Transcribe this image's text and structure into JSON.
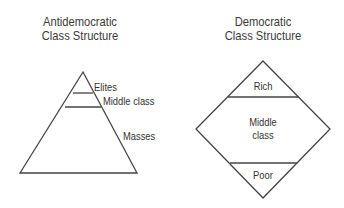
{
  "left_diagram": {
    "title_line1": "Antidemocratic",
    "title_line2": "Class Structure",
    "shape": "triangle",
    "layers": [
      {
        "label": "Elites"
      },
      {
        "label": "Middle class"
      },
      {
        "label": "Masses"
      }
    ]
  },
  "right_diagram": {
    "title_line1": "Democratic",
    "title_line2": "Class Structure",
    "shape": "diamond",
    "layers": [
      {
        "label": "Rich"
      },
      {
        "label_line1": "Middle",
        "label_line2": "class"
      },
      {
        "label": "Poor"
      }
    ]
  },
  "colors": {
    "stroke": "#444444",
    "text": "#333333",
    "background": "#ffffff"
  }
}
